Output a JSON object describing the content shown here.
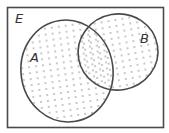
{
  "diagram": {
    "type": "venn",
    "universe_label": "E",
    "sets": [
      {
        "label": "A",
        "cx": 67,
        "cy": 71,
        "rx": 46,
        "ry": 51,
        "rotate": -8
      },
      {
        "label": "B",
        "cx": 118,
        "cy": 52,
        "rx": 40,
        "ry": 38,
        "rotate": -10
      }
    ],
    "shaded_region": "A ∪ B",
    "shading_style": "dotted",
    "colors": {
      "stroke": "#4a4a4a",
      "dot": "#6a6a6a",
      "background": "#ffffff"
    }
  }
}
